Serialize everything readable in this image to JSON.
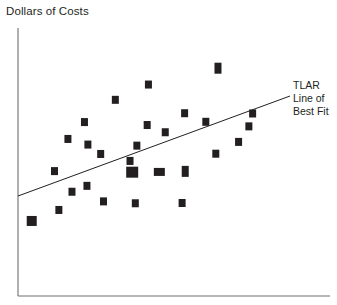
{
  "chart_data": {
    "type": "scatter",
    "title": "Dollars of Costs",
    "xlabel": "",
    "ylabel": "Dollars of Costs",
    "grid": false,
    "axes": {
      "style": "L-shaped spines, no tick marks, no tick labels",
      "y_axis_x": 18,
      "y_axis_top": 28,
      "x_axis_y": 296,
      "x_axis_right": 330,
      "color": "#6d6e71"
    },
    "xlim": [
      0,
      100
    ],
    "ylim": [
      0,
      100
    ],
    "points": [
      {
        "x": 4.4,
        "y": 28.0,
        "size": "large"
      },
      {
        "x": 13.1,
        "y": 32.1,
        "size": "small"
      },
      {
        "x": 11.7,
        "y": 46.6,
        "size": "small"
      },
      {
        "x": 17.3,
        "y": 38.9,
        "size": "small"
      },
      {
        "x": 22.4,
        "y": 56.5,
        "size": "small"
      },
      {
        "x": 21.3,
        "y": 64.9,
        "size": "small"
      },
      {
        "x": 27.4,
        "y": 35.3,
        "size": "small"
      },
      {
        "x": 22.1,
        "y": 41.1,
        "size": "small"
      },
      {
        "x": 16.0,
        "y": 58.6,
        "size": "small"
      },
      {
        "x": 26.5,
        "y": 53.0,
        "size": "small"
      },
      {
        "x": 31.2,
        "y": 73.2,
        "size": "small"
      },
      {
        "x": 41.4,
        "y": 63.8,
        "size": "small"
      },
      {
        "x": 35.9,
        "y": 50.4,
        "size": "small"
      },
      {
        "x": 38.1,
        "y": 56.1,
        "size": "small"
      },
      {
        "x": 37.6,
        "y": 34.6,
        "size": "small"
      },
      {
        "x": 41.8,
        "y": 78.9,
        "size": "small"
      },
      {
        "x": 36.6,
        "y": 46.2,
        "size": "xlarge"
      },
      {
        "x": 45.3,
        "y": 46.3,
        "size": "wide"
      },
      {
        "x": 53.6,
        "y": 46.5,
        "size": "tall"
      },
      {
        "x": 52.6,
        "y": 34.7,
        "size": "small"
      },
      {
        "x": 47.2,
        "y": 61.1,
        "size": "small"
      },
      {
        "x": 53.4,
        "y": 68.2,
        "size": "small"
      },
      {
        "x": 60.2,
        "y": 65.0,
        "size": "small"
      },
      {
        "x": 64.1,
        "y": 85.0,
        "size": "tall"
      },
      {
        "x": 63.4,
        "y": 53.1,
        "size": "small"
      },
      {
        "x": 70.7,
        "y": 57.5,
        "size": "small"
      },
      {
        "x": 75.2,
        "y": 68.1,
        "size": "small"
      },
      {
        "x": 74.0,
        "y": 63.3,
        "size": "small"
      }
    ],
    "trendline": {
      "label_lines": [
        "TLAR",
        "Line of",
        "Best Fit"
      ],
      "label_full": "TLAR Line of Best Fit",
      "x_start_px": 18,
      "y_start_px": 196,
      "x_end_px": 290,
      "y_end_px": 96,
      "color": "#231f20"
    },
    "marker": {
      "color": "#231f20",
      "shape": "square"
    }
  }
}
